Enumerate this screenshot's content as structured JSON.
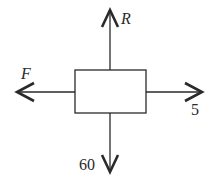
{
  "diagram": {
    "type": "free-body-diagram",
    "body": {
      "shape": "rectangle"
    },
    "forces": [
      {
        "direction": "up",
        "label": "R"
      },
      {
        "direction": "left",
        "label": "F"
      },
      {
        "direction": "right",
        "label": "5"
      },
      {
        "direction": "down",
        "label": "60"
      }
    ],
    "colors": {
      "stroke": "#2a2a2a",
      "background": "#ffffff"
    }
  }
}
